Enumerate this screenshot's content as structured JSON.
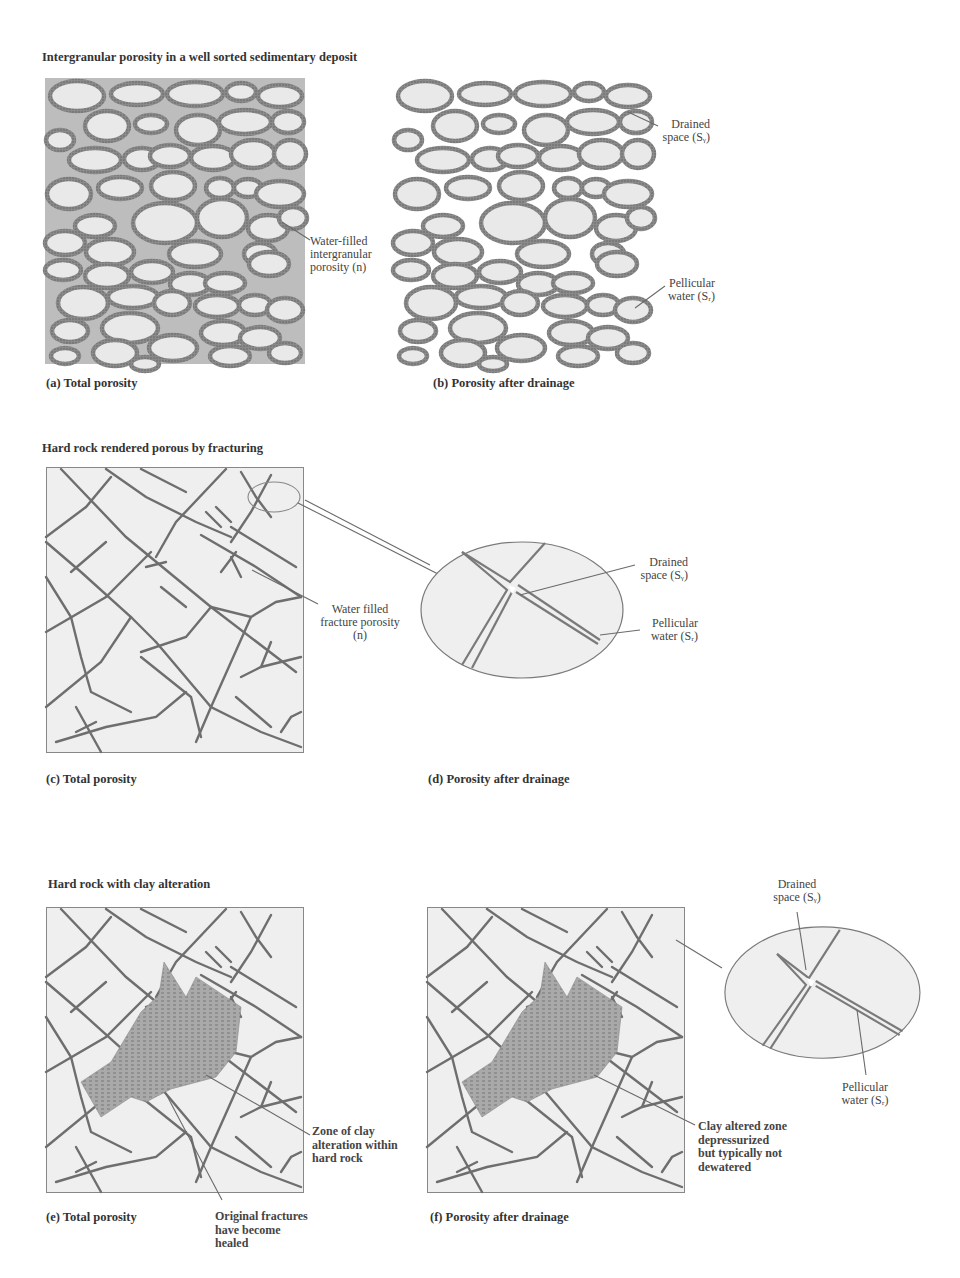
{
  "sections": [
    {
      "title": "Intergranular porosity in a well sorted sedimentary deposit",
      "panels": [
        {
          "caption": "(a) Total porosity",
          "annotations": [
            {
              "text_lines": [
                "Water-filled",
                "intergranular",
                "porosity (n)"
              ]
            }
          ]
        },
        {
          "caption": "(b) Porosity after drainage",
          "annotations": [
            {
              "text_lines": [
                "Drained",
                "space (Sᵧ)"
              ]
            },
            {
              "text_lines": [
                "Pellicular",
                "water (Sᵣ)"
              ]
            }
          ]
        }
      ]
    },
    {
      "title": "Hard rock rendered porous by fracturing",
      "panels": [
        {
          "caption": "(c) Total porosity",
          "annotations": [
            {
              "text_lines": [
                "Water filled",
                "fracture porosity",
                "(n)"
              ]
            }
          ]
        },
        {
          "caption": "(d) Porosity after drainage",
          "annotations": [
            {
              "text_lines": [
                "Drained",
                "space (Sᵧ)"
              ]
            },
            {
              "text_lines": [
                "Pellicular",
                "water (Sᵣ)"
              ]
            }
          ]
        }
      ]
    },
    {
      "title": "Hard rock with clay alteration",
      "panels": [
        {
          "caption": "(e) Total porosity",
          "annotations": [
            {
              "text_lines": [
                "Zone of clay",
                "alteration within",
                "hard rock"
              ]
            },
            {
              "text_lines": [
                "Original fractures",
                "have become",
                "healed"
              ]
            }
          ]
        },
        {
          "caption": "(f) Porosity after drainage",
          "annotations": [
            {
              "text_lines": [
                "Clay altered zone",
                "depressurized",
                "but typically not",
                "dewatered"
              ]
            },
            {
              "text_lines": [
                "Drained",
                "space (Sᵧ)"
              ]
            },
            {
              "text_lines": [
                "Pellicular",
                "water (Sᵣ)"
              ]
            }
          ]
        }
      ]
    }
  ],
  "colors": {
    "background": "#ffffff",
    "water_fill": "#b9b9b9",
    "grain_fill": "#e8e8e8",
    "grain_rim": "#7a7a7a",
    "rock_fill": "#efefef",
    "fracture": "#6e6e6e",
    "clay_zone": "#a8a8a8",
    "text": "#3a3a3a"
  }
}
